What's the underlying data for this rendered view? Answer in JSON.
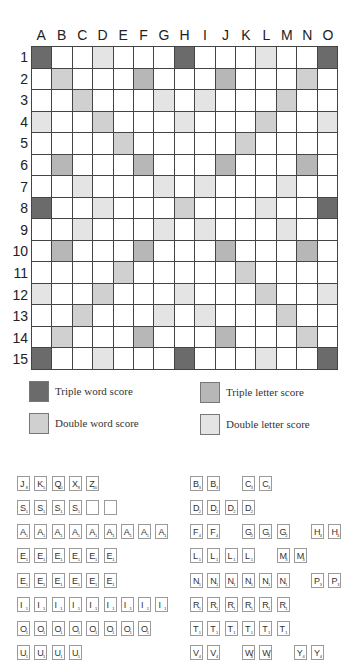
{
  "board": {
    "columns": [
      "A",
      "B",
      "C",
      "D",
      "E",
      "F",
      "G",
      "H",
      "I",
      "J",
      "K",
      "L",
      "M",
      "N",
      "O"
    ],
    "rows": [
      "1",
      "2",
      "3",
      "4",
      "5",
      "6",
      "7",
      "8",
      "9",
      "10",
      "11",
      "12",
      "13",
      "14",
      "15"
    ],
    "layout": [
      "T..d...T...d..T",
      ".D...t...t...D.",
      "..D...d.d...D..",
      "d..D...d...D..d",
      "....D.....D....",
      ".t...t...t...t.",
      "..d...d.d...d..",
      "T..d...D...d..T",
      "..d...d.d...d..",
      ".t...t...t...t.",
      "....D.....D....",
      "d..D...d...D..d",
      "..D...d.d...D..",
      ".D...t...t...D.",
      "T..d...T...d..T"
    ],
    "layout_key": {
      "T": "triple-word",
      "t": "triple-letter",
      "D": "double-word",
      "d": "double-letter",
      ".": "plain"
    },
    "colors": {
      "triple_word": "#6b6b6b",
      "triple_letter": "#b7b7b7",
      "double_word": "#d0d0d0",
      "double_letter": "#e4e4e4",
      "plain": "#ffffff"
    }
  },
  "legend": {
    "triple_word": "Triple word score",
    "triple_letter": "Triple letter score",
    "double_word": "Double word score",
    "double_letter": "Double letter score"
  },
  "tiles": {
    "left": [
      [
        {
          "l": "J",
          "v": "8"
        },
        {
          "l": "K",
          "v": "5"
        },
        {
          "l": "Q",
          "v": "10"
        },
        {
          "l": "X",
          "v": "8"
        },
        {
          "l": "Z",
          "v": "10"
        }
      ],
      [
        {
          "l": "S",
          "v": "1"
        },
        {
          "l": "S",
          "v": "1"
        },
        {
          "l": "S",
          "v": "1"
        },
        {
          "l": "S",
          "v": "1"
        },
        {
          "l": "",
          "v": ""
        },
        {
          "l": "",
          "v": ""
        }
      ],
      [
        {
          "l": "A",
          "v": "1"
        },
        {
          "l": "A",
          "v": "1"
        },
        {
          "l": "A",
          "v": "1"
        },
        {
          "l": "A",
          "v": "1"
        },
        {
          "l": "A",
          "v": "1"
        },
        {
          "l": "A",
          "v": "1"
        },
        {
          "l": "A",
          "v": "1"
        },
        {
          "l": "A",
          "v": "1"
        },
        {
          "l": "A",
          "v": "1"
        }
      ],
      [
        {
          "l": "E",
          "v": "1"
        },
        {
          "l": "E",
          "v": "1"
        },
        {
          "l": "E",
          "v": "1"
        },
        {
          "l": "E",
          "v": "1"
        },
        {
          "l": "E",
          "v": "1"
        },
        {
          "l": "E",
          "v": "1"
        }
      ],
      [
        {
          "l": "E",
          "v": "1"
        },
        {
          "l": "E",
          "v": "1"
        },
        {
          "l": "E",
          "v": "1"
        },
        {
          "l": "E",
          "v": "1"
        },
        {
          "l": "E",
          "v": "1"
        },
        {
          "l": "E",
          "v": "1"
        }
      ],
      [
        {
          "l": "I",
          "v": "1"
        },
        {
          "l": "I",
          "v": "1"
        },
        {
          "l": "I",
          "v": "1"
        },
        {
          "l": "I",
          "v": "1"
        },
        {
          "l": "I",
          "v": "1"
        },
        {
          "l": "I",
          "v": "1"
        },
        {
          "l": "I",
          "v": "1"
        },
        {
          "l": "I",
          "v": "1"
        },
        {
          "l": "I",
          "v": "1"
        }
      ],
      [
        {
          "l": "O",
          "v": "1"
        },
        {
          "l": "O",
          "v": "1"
        },
        {
          "l": "O",
          "v": "1"
        },
        {
          "l": "O",
          "v": "1"
        },
        {
          "l": "O",
          "v": "1"
        },
        {
          "l": "O",
          "v": "1"
        },
        {
          "l": "O",
          "v": "1"
        },
        {
          "l": "O",
          "v": "1"
        }
      ],
      [
        {
          "l": "U",
          "v": "1"
        },
        {
          "l": "U",
          "v": "1"
        },
        {
          "l": "U",
          "v": "1"
        },
        {
          "l": "U",
          "v": "1"
        }
      ]
    ],
    "right": [
      [
        {
          "l": "B",
          "v": "3",
          "s": 0
        },
        {
          "l": "B",
          "v": "3",
          "s": 1
        },
        {
          "l": "C",
          "v": "3",
          "s": 3
        },
        {
          "l": "C",
          "v": "3",
          "s": 4
        }
      ],
      [
        {
          "l": "D",
          "v": "2",
          "s": 0
        },
        {
          "l": "D",
          "v": "2",
          "s": 1
        },
        {
          "l": "D",
          "v": "2",
          "s": 2
        },
        {
          "l": "D",
          "v": "2",
          "s": 3
        }
      ],
      [
        {
          "l": "F",
          "v": "4",
          "s": 0
        },
        {
          "l": "F",
          "v": "4",
          "s": 1
        },
        {
          "l": "G",
          "v": "2",
          "s": 3
        },
        {
          "l": "G",
          "v": "2",
          "s": 4
        },
        {
          "l": "G",
          "v": "2",
          "s": 5
        },
        {
          "l": "H",
          "v": "4",
          "s": 7
        },
        {
          "l": "H",
          "v": "4",
          "s": 8
        }
      ],
      [
        {
          "l": "L",
          "v": "1",
          "s": 0
        },
        {
          "l": "L",
          "v": "1",
          "s": 1
        },
        {
          "l": "L",
          "v": "1",
          "s": 2
        },
        {
          "l": "L",
          "v": "1",
          "s": 3
        },
        {
          "l": "M",
          "v": "3",
          "s": 5
        },
        {
          "l": "M",
          "v": "3",
          "s": 6
        }
      ],
      [
        {
          "l": "N",
          "v": "1",
          "s": 0
        },
        {
          "l": "N",
          "v": "1",
          "s": 1
        },
        {
          "l": "N",
          "v": "1",
          "s": 2
        },
        {
          "l": "N",
          "v": "1",
          "s": 3
        },
        {
          "l": "N",
          "v": "1",
          "s": 4
        },
        {
          "l": "N",
          "v": "1",
          "s": 5
        },
        {
          "l": "P",
          "v": "3",
          "s": 7
        },
        {
          "l": "P",
          "v": "3",
          "s": 8
        }
      ],
      [
        {
          "l": "R",
          "v": "1",
          "s": 0
        },
        {
          "l": "R",
          "v": "1",
          "s": 1
        },
        {
          "l": "R",
          "v": "1",
          "s": 2
        },
        {
          "l": "R",
          "v": "1",
          "s": 3
        },
        {
          "l": "R",
          "v": "1",
          "s": 4
        },
        {
          "l": "R",
          "v": "1",
          "s": 5
        }
      ],
      [
        {
          "l": "T",
          "v": "1",
          "s": 0
        },
        {
          "l": "T",
          "v": "1",
          "s": 1
        },
        {
          "l": "T",
          "v": "1",
          "s": 2
        },
        {
          "l": "T",
          "v": "1",
          "s": 3
        },
        {
          "l": "T",
          "v": "1",
          "s": 4
        },
        {
          "l": "T",
          "v": "1",
          "s": 5
        }
      ],
      [
        {
          "l": "V",
          "v": "4",
          "s": 0
        },
        {
          "l": "V",
          "v": "4",
          "s": 1
        },
        {
          "l": "W",
          "v": "4",
          "s": 3
        },
        {
          "l": "W",
          "v": "4",
          "s": 4
        },
        {
          "l": "Y",
          "v": "4",
          "s": 6
        },
        {
          "l": "Y",
          "v": "4",
          "s": 7
        }
      ]
    ]
  }
}
